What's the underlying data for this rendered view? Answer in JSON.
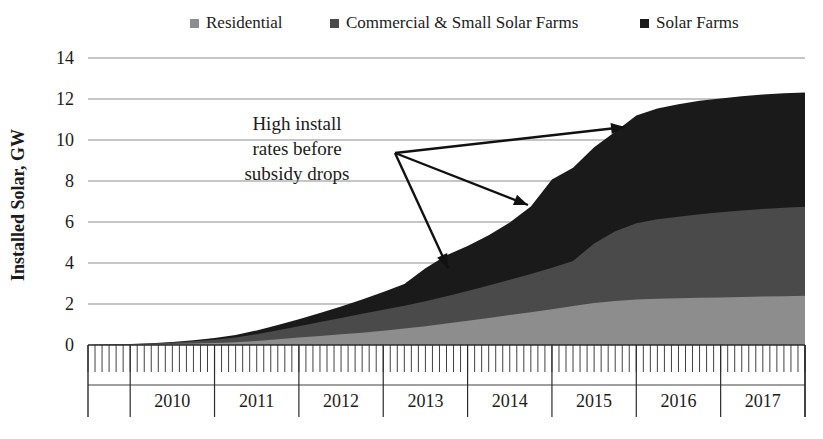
{
  "chart_data": {
    "type": "area",
    "stacked": true,
    "title": "",
    "xlabel": "",
    "ylabel": "Installed Solar, GW",
    "ylim": [
      0,
      14
    ],
    "yticks": [
      0,
      2,
      4,
      6,
      8,
      10,
      12,
      14
    ],
    "ytick_labels": [
      "0",
      "2",
      "4",
      "6",
      "8",
      "10",
      "12",
      "14"
    ],
    "grid": true,
    "legend_position": "top",
    "xlim": [
      "2009-07",
      "2017-12"
    ],
    "x_major_labels": [
      "2010",
      "2011",
      "2012",
      "2013",
      "2014",
      "2015",
      "2016",
      "2017"
    ],
    "x_minor_tick_interval": "month",
    "x": [
      "2009-07",
      "2009-10",
      "2010-01",
      "2010-04",
      "2010-07",
      "2010-10",
      "2011-01",
      "2011-04",
      "2011-07",
      "2011-10",
      "2012-01",
      "2012-04",
      "2012-07",
      "2012-10",
      "2013-01",
      "2013-04",
      "2013-07",
      "2013-10",
      "2014-01",
      "2014-04",
      "2014-07",
      "2014-10",
      "2015-01",
      "2015-04",
      "2015-07",
      "2015-10",
      "2016-01",
      "2016-04",
      "2016-07",
      "2016-10",
      "2017-01",
      "2017-04",
      "2017-07",
      "2017-10",
      "2017-12"
    ],
    "series": [
      {
        "name": "Residential",
        "color": "#8d8d8d",
        "values": [
          0.0,
          0.01,
          0.02,
          0.03,
          0.05,
          0.07,
          0.1,
          0.14,
          0.2,
          0.28,
          0.36,
          0.44,
          0.52,
          0.6,
          0.7,
          0.8,
          0.92,
          1.05,
          1.18,
          1.32,
          1.46,
          1.6,
          1.75,
          1.9,
          2.05,
          2.15,
          2.22,
          2.26,
          2.28,
          2.3,
          2.32,
          2.34,
          2.36,
          2.38,
          2.4
        ]
      },
      {
        "name": "Commercial & Small Solar Farms",
        "color": "#4a4a4a",
        "values": [
          0.0,
          0.01,
          0.02,
          0.04,
          0.07,
          0.11,
          0.16,
          0.23,
          0.33,
          0.44,
          0.56,
          0.68,
          0.8,
          0.92,
          1.02,
          1.12,
          1.22,
          1.33,
          1.45,
          1.58,
          1.72,
          1.86,
          2.02,
          2.2,
          2.9,
          3.4,
          3.72,
          3.88,
          3.98,
          4.08,
          4.15,
          4.22,
          4.28,
          4.32,
          4.34
        ]
      },
      {
        "name": "Solar Farms",
        "color": "#1a1a1a",
        "values": [
          0.0,
          0.0,
          0.01,
          0.02,
          0.03,
          0.05,
          0.08,
          0.12,
          0.18,
          0.26,
          0.34,
          0.44,
          0.56,
          0.7,
          0.86,
          1.05,
          1.6,
          2.0,
          2.2,
          2.45,
          2.8,
          3.3,
          4.3,
          4.55,
          4.7,
          4.85,
          5.25,
          5.4,
          5.48,
          5.54,
          5.56,
          5.58,
          5.58,
          5.58,
          5.58
        ]
      }
    ],
    "total_final": 12.32,
    "annotations": [
      {
        "text_lines": [
          "High install",
          "rates before",
          "subsidy drops"
        ],
        "arrows": [
          {
            "from": [
              395,
              153
            ],
            "to": [
              625,
              127
            ]
          },
          {
            "from": [
              395,
              153
            ],
            "to": [
              528,
              205
            ]
          },
          {
            "from": [
              395,
              153
            ],
            "to": [
              448,
              268
            ]
          }
        ]
      }
    ]
  },
  "legend": {
    "items": [
      {
        "label": "Residential",
        "color": "#8d8d8d"
      },
      {
        "label": "Commercial & Small Solar Farms",
        "color": "#4a4a4a"
      },
      {
        "label": "Solar Farms",
        "color": "#1a1a1a"
      }
    ]
  },
  "axes": {
    "y_title": "Installed Solar, GW",
    "y_labels": [
      "14",
      "12",
      "10",
      "8",
      "6",
      "4",
      "2",
      "0"
    ],
    "x_labels": [
      "2010",
      "2011",
      "2012",
      "2013",
      "2014",
      "2015",
      "2016",
      "2017"
    ]
  },
  "annotation": {
    "line1": "High install",
    "line2": "rates before",
    "line3": "subsidy drops"
  }
}
